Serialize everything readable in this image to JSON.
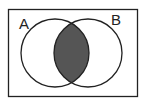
{
  "diagram": {
    "type": "venn",
    "sets": [
      {
        "label": "A",
        "cx": 55,
        "cy": 53,
        "r": 34
      },
      {
        "label": "B",
        "cx": 88,
        "cy": 53,
        "r": 34
      }
    ],
    "shaded_region": "A ∩ B",
    "colors": {
      "stroke": "#222222",
      "shade": "#555555",
      "background": "#ffffff"
    }
  }
}
